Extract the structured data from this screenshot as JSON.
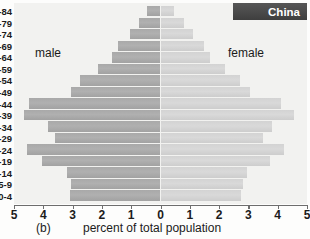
{
  "figure": {
    "panel_caption": "(b)",
    "country_label": "China",
    "male_label": "male",
    "female_label": "female"
  },
  "colors": {
    "male_bar": "#a9a9a9",
    "female_bar": "#d3d3d3",
    "plot_background": "#f2f2f0",
    "country_box": "#4a4a4a",
    "country_text": "#ffffff",
    "axis": "#6d6d6d",
    "text": "#1b1b1b"
  },
  "chart_data": {
    "type": "bar",
    "subtype": "population-pyramid",
    "title": "China",
    "xlabel": "percent of total population",
    "ylabel": "",
    "xlim": [
      -5,
      5
    ],
    "xticks": [
      5,
      4,
      3,
      2,
      1,
      0,
      1,
      2,
      3,
      4,
      5
    ],
    "xtick_labels": [
      "5",
      "4",
      "3",
      "2",
      "1",
      "0",
      "1",
      "2",
      "3",
      "4",
      "5"
    ],
    "grid": false,
    "legend_position": "inside-top",
    "categories": [
      "80-84",
      "75-79",
      "70-74",
      "65-69",
      "60-64",
      "55-59",
      "50-54",
      "45-49",
      "40-44",
      "35-39",
      "30-34",
      "25-29",
      "20-24",
      "15-19",
      "10-14",
      "5-9",
      "0-4"
    ],
    "ytick_labels_clipped": [
      "4",
      "9",
      "4",
      "9",
      "4",
      "9",
      "4",
      "9",
      "4",
      "9",
      "4",
      "9",
      "4",
      "9",
      "4",
      "9",
      "4"
    ],
    "series": [
      {
        "name": "male",
        "side": "left",
        "color": "#a9a9a9",
        "values": [
          0.45,
          0.75,
          1.05,
          1.45,
          1.65,
          2.15,
          2.75,
          3.05,
          4.5,
          4.65,
          3.85,
          3.6,
          4.55,
          4.05,
          3.2,
          3.05,
          3.1
        ]
      },
      {
        "name": "female",
        "side": "right",
        "color": "#d3d3d3",
        "values": [
          0.45,
          0.8,
          1.1,
          1.5,
          1.7,
          2.2,
          2.7,
          3.05,
          4.1,
          4.55,
          3.8,
          3.5,
          4.2,
          3.75,
          2.95,
          2.8,
          2.75
        ]
      }
    ]
  }
}
